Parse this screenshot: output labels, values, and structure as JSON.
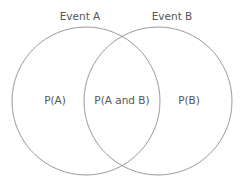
{
  "diagram": {
    "type": "venn",
    "stroke_color": "#9a9a9a",
    "text_color": "#555555",
    "background": "#ffffff",
    "sets": [
      {
        "name": "Event A",
        "region_label": "P(A)",
        "cx": 86,
        "cy": 101,
        "r": 74
      },
      {
        "name": "Event B",
        "region_label": "P(B)",
        "cx": 158,
        "cy": 101,
        "r": 74
      }
    ],
    "intersection_label": "P(A and B)"
  }
}
